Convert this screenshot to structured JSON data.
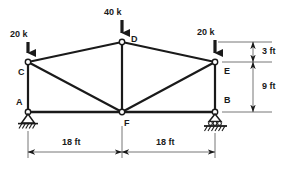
{
  "figure": {
    "type": "statics-truss-free-body-diagram",
    "stroke_color": "#1a1a1a",
    "background_color": "#ffffff"
  },
  "joints": [
    {
      "id": "A",
      "label": "A",
      "x": 28,
      "y": 112,
      "support": "pin"
    },
    {
      "id": "B",
      "label": "B",
      "x": 215,
      "y": 112,
      "support": "roller"
    },
    {
      "id": "C",
      "label": "C",
      "x": 28,
      "y": 62,
      "support": "none"
    },
    {
      "id": "D",
      "label": "D",
      "x": 122,
      "y": 42,
      "support": "none"
    },
    {
      "id": "E",
      "label": "E",
      "x": 215,
      "y": 62,
      "support": "none"
    },
    {
      "id": "F",
      "label": "F",
      "x": 122,
      "y": 112,
      "support": "none"
    }
  ],
  "members": [
    {
      "from": "A",
      "to": "F"
    },
    {
      "from": "F",
      "to": "B"
    },
    {
      "from": "A",
      "to": "C"
    },
    {
      "from": "B",
      "to": "E"
    },
    {
      "from": "C",
      "to": "D"
    },
    {
      "from": "D",
      "to": "E"
    },
    {
      "from": "C",
      "to": "F"
    },
    {
      "from": "D",
      "to": "F"
    },
    {
      "from": "F",
      "to": "E"
    }
  ],
  "loads": [
    {
      "id": "load-C",
      "label": "20 k",
      "at_joint": "C",
      "direction": "down",
      "label_x": 10,
      "label_y": 30,
      "arrow_x": 28,
      "arrow_top": 42,
      "arrow_bottom": 60
    },
    {
      "id": "load-D",
      "label": "40 k",
      "at_joint": "D",
      "direction": "down",
      "label_x": 104,
      "label_y": 8,
      "arrow_x": 122,
      "arrow_top": 20,
      "arrow_bottom": 40
    },
    {
      "id": "load-E",
      "label": "20 k",
      "at_joint": "E",
      "direction": "down",
      "label_x": 197,
      "label_y": 28,
      "arrow_x": 215,
      "arrow_top": 40,
      "arrow_bottom": 60
    }
  ],
  "dimensions": [
    {
      "id": "dim-span-left",
      "label": "18 ft",
      "orientation": "horizontal",
      "from_x": 28,
      "to_x": 122,
      "y": 152,
      "label_x": 62,
      "label_y": 138
    },
    {
      "id": "dim-span-right",
      "label": "18 ft",
      "orientation": "horizontal",
      "from_x": 122,
      "to_x": 215,
      "y": 152,
      "label_x": 156,
      "label_y": 138
    },
    {
      "id": "dim-height-top",
      "label": "3 ft",
      "orientation": "vertical",
      "from_y": 42,
      "to_y": 62,
      "x": 253,
      "label_x": 262,
      "label_y": 47
    },
    {
      "id": "dim-height-bot",
      "label": "9 ft",
      "orientation": "vertical",
      "from_y": 62,
      "to_y": 112,
      "x": 253,
      "label_x": 262,
      "label_y": 82
    }
  ],
  "joint_labels": [
    {
      "for": "C",
      "text": "C",
      "x": 18,
      "y": 68
    },
    {
      "for": "A",
      "text": "A",
      "x": 16,
      "y": 98
    },
    {
      "for": "D",
      "text": "D",
      "x": 131,
      "y": 35
    },
    {
      "for": "E",
      "text": "E",
      "x": 224,
      "y": 67
    },
    {
      "for": "B",
      "text": "B",
      "x": 224,
      "y": 96
    },
    {
      "for": "F",
      "text": "F",
      "x": 124,
      "y": 119
    }
  ]
}
